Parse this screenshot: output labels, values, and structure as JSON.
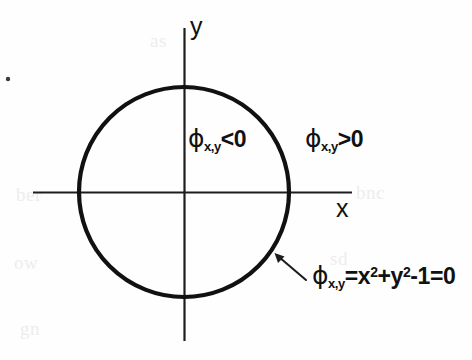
{
  "figure": {
    "background_color": "#fefefe",
    "ink_color": "#111111",
    "axes": {
      "x_label": "x",
      "y_label": "y",
      "origin_px": [
        184,
        192
      ],
      "x_axis_extent_px": [
        33,
        352
      ],
      "y_axis_extent_px": [
        28,
        341
      ]
    },
    "circle": {
      "center_px": [
        184,
        192
      ],
      "radius_px": 105,
      "stroke_width_px": 4,
      "stroke_color": "#111111",
      "fill": "none"
    },
    "labels": {
      "inside": {
        "phi": "ϕ",
        "subscript": "x,y",
        "relation": "<0",
        "full_text": "ϕx,y<0"
      },
      "outside": {
        "phi": "ϕ",
        "subscript": "x,y",
        "relation": ">0",
        "full_text": "ϕx,y>0"
      },
      "equation": {
        "phi": "ϕ",
        "subscript": "x,y",
        "equals": "=",
        "term_x": "x",
        "exp_x": "2",
        "plus": "+",
        "term_y": "y",
        "exp_y": "2",
        "minus_one": "-1",
        "equals_zero": "=0",
        "full_text": "ϕx,y=x2+y2-1=0"
      }
    },
    "annotation_arrow": {
      "tip_px": [
        276,
        254
      ],
      "tail_px": [
        305,
        279
      ],
      "points_to": "circle-boundary"
    },
    "stray_dot": {
      "position_px": [
        8,
        79
      ],
      "radius_px": 2
    },
    "ghost_text": [
      "bnc",
      "ber",
      "ow",
      "sd",
      "as",
      "gn"
    ]
  }
}
